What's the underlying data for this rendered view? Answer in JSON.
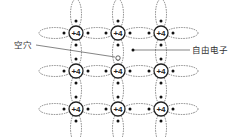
{
  "diagram": {
    "title": "",
    "atom_charge": "+4",
    "rows": 3,
    "cols": 3,
    "atoms_x": [
      76,
      118,
      161
    ],
    "atoms_y": [
      33,
      71,
      109
    ],
    "labels": {
      "hole": "空穴",
      "free_electron": "自由电子"
    },
    "hole_position": [
      118,
      58
    ],
    "free_electron_position": [
      133,
      50
    ],
    "colors": {
      "line": "#333333",
      "bond": "#555555",
      "background": "#ffffff"
    }
  }
}
